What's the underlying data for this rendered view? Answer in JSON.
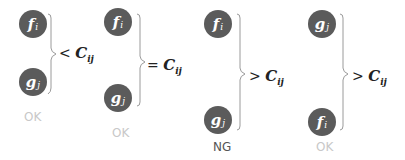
{
  "panels": [
    {
      "top_node": {
        "letter": "f",
        "sub": "i"
      },
      "bottom_node": {
        "letter": "g",
        "sub": "j"
      },
      "relation": "<",
      "constant": {
        "letter": "C",
        "sub": "ij"
      },
      "status": "OK"
    },
    {
      "top_node": {
        "letter": "f",
        "sub": "i"
      },
      "bottom_node": {
        "letter": "g",
        "sub": "j"
      },
      "relation": "=",
      "constant": {
        "letter": "C",
        "sub": "ij"
      },
      "status": "OK"
    },
    {
      "top_node": {
        "letter": "f",
        "sub": "i"
      },
      "bottom_node": {
        "letter": "g",
        "sub": "j"
      },
      "relation": ">",
      "constant": {
        "letter": "C",
        "sub": "ij"
      },
      "status": "NG"
    },
    {
      "top_node": {
        "letter": "g",
        "sub": "j"
      },
      "bottom_node": {
        "letter": "f",
        "sub": "i"
      },
      "relation": ">",
      "constant": {
        "letter": "C",
        "sub": "ij"
      },
      "status": "OK"
    }
  ],
  "colors": {
    "node": "#5b5b5b",
    "ok": "#c8c8c8",
    "ng": "#555555",
    "brace": "#9a9a9a"
  }
}
